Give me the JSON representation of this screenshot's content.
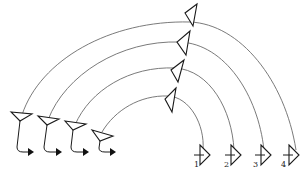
{
  "diagram": {
    "line_color": "#6b6b6b",
    "stroke_color": "#1a1a1a",
    "transmitters": [
      {
        "id": "tx-1"
      },
      {
        "id": "tx-2"
      },
      {
        "id": "tx-3"
      },
      {
        "id": "tx-4"
      }
    ],
    "relays": [
      {
        "id": "relay-1"
      },
      {
        "id": "relay-2"
      },
      {
        "id": "relay-3"
      },
      {
        "id": "relay-4"
      }
    ],
    "receivers": [
      {
        "id": "rx-1",
        "label": "1"
      },
      {
        "id": "rx-2",
        "label": "2"
      },
      {
        "id": "rx-3",
        "label": "3"
      },
      {
        "id": "rx-4",
        "label": "4"
      }
    ]
  }
}
